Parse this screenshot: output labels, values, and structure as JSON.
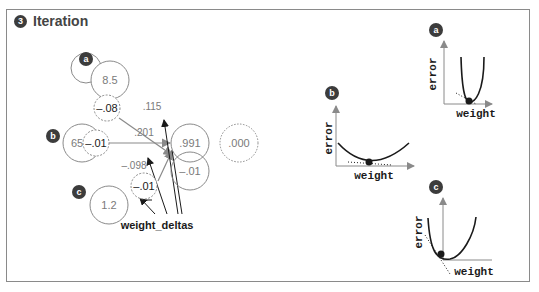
{
  "header": {
    "step": "3",
    "title": "Iteration"
  },
  "network": {
    "inputs": [
      {
        "id": "a",
        "value": "8.5"
      },
      {
        "id": "b",
        "value": "65%"
      },
      {
        "id": "c",
        "value": "1.2"
      }
    ],
    "weight_deltas": [
      "-.08",
      "-.01",
      "-.01"
    ],
    "weights": [
      ".115",
      ".201",
      "-.098"
    ],
    "prediction": ".991",
    "delta": "-.01",
    "goal": ".000",
    "annotation": "weight_deltas"
  },
  "plots": [
    {
      "id": "a",
      "xlabel": "weight",
      "ylabel": "error"
    },
    {
      "id": "b",
      "xlabel": "weight",
      "ylabel": "error"
    },
    {
      "id": "c",
      "xlabel": "weight",
      "ylabel": "error"
    }
  ],
  "colors": {
    "node_stroke": "#8a8a8a",
    "text_gray": "#7a7a7a",
    "dark": "#1a1a1a",
    "badge": "#3c3c3c"
  }
}
